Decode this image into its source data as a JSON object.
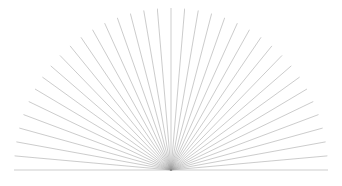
{
  "figure": {
    "type": "radial-ray-burst",
    "canvas": {
      "width": 342,
      "height": 186,
      "background_color": "#ffffff"
    },
    "hub": {
      "label": "convergence-point",
      "x": 171,
      "y": 170
    },
    "rays": {
      "count": 37,
      "color": "#9a9a9a",
      "stroke_width": 0.6,
      "opacity": 0.85,
      "start_angle_deg": 180,
      "end_angle_deg": 360,
      "sweep_deg": 180,
      "radius_x": 157,
      "radius_y": 162,
      "description": "Thin gray straight lines radiating from a single bottom-center hub across a 180 degree semicircular sweep, terminating on an elliptical outer boundary."
    }
  },
  "chart_data": {
    "type": "scatter",
    "subtitle": "",
    "xlabel": "",
    "ylabel": "",
    "grid": false,
    "legend_position": "none",
    "xlim": [
      0,
      342
    ],
    "ylim": [
      0,
      186
    ],
    "origin": {
      "x": 171,
      "y": 170
    },
    "series": [
      {
        "name": "rays",
        "angles_deg": [
          180,
          185,
          190,
          195,
          200,
          205,
          210,
          215,
          220,
          225,
          230,
          235,
          240,
          245,
          250,
          255,
          260,
          265,
          270,
          275,
          280,
          285,
          290,
          295,
          300,
          305,
          310,
          315,
          320,
          325,
          330,
          335,
          340,
          345,
          350,
          355,
          360
        ],
        "radius_x": 157,
        "radius_y": 162,
        "color": "#9a9a9a",
        "values": [
          1,
          1,
          1,
          1,
          1,
          1,
          1,
          1,
          1,
          1,
          1,
          1,
          1,
          1,
          1,
          1,
          1,
          1,
          1,
          1,
          1,
          1,
          1,
          1,
          1,
          1,
          1,
          1,
          1,
          1,
          1,
          1,
          1,
          1,
          1,
          1,
          1
        ]
      }
    ],
    "annotations": []
  }
}
